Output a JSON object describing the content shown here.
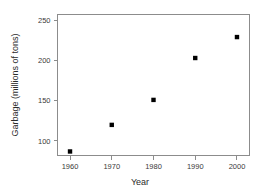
{
  "chart_data": {
    "type": "scatter",
    "title": "",
    "xlabel": "Year",
    "ylabel": "Garbage (millions of tons)",
    "x": [
      1960,
      1970,
      1980,
      1990,
      2000
    ],
    "values": [
      87,
      120,
      151,
      203,
      229
    ],
    "series": [
      {
        "name": "Garbage",
        "values": [
          87,
          120,
          151,
          203,
          229
        ]
      }
    ],
    "xlim": [
      1957,
      2003
    ],
    "ylim": [
      82,
      257
    ],
    "xticks": [
      1960,
      1970,
      1980,
      1990,
      2000
    ],
    "yticks": [
      100,
      150,
      200,
      250
    ],
    "xtick_labels": [
      "1960",
      "1970",
      "1980",
      "1990",
      "2000"
    ],
    "ytick_labels": [
      "100",
      "150",
      "200",
      "250"
    ],
    "grid": false,
    "legend": false,
    "marker": "filled-square",
    "marker_color": "#000000",
    "axis_color": "#8c8c8c",
    "background": "#ffffff"
  },
  "axes": {
    "x_title": "Year",
    "y_title": "Garbage (millions of tons)"
  }
}
